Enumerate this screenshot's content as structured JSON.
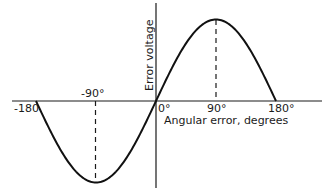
{
  "chart_data": {
    "type": "line",
    "title": "",
    "xlabel": "Angular error, degrees",
    "ylabel": "Error voltage",
    "x_ticks": [
      "-180",
      "-90°",
      "0°",
      "90°",
      "180°"
    ],
    "x_tick_values": [
      -180,
      -90,
      0,
      90,
      180
    ],
    "xlim": [
      -200,
      240
    ],
    "ylim": [
      -1.05,
      1.05
    ],
    "grid": false,
    "legend": null,
    "series": [
      {
        "name": "Error voltage",
        "function": "sin(x)",
        "x": [
          -180,
          -150,
          -120,
          -90,
          -60,
          -30,
          0,
          30,
          60,
          90,
          120,
          150,
          180
        ],
        "values": [
          0,
          -0.5,
          -0.866,
          -1,
          -0.866,
          -0.5,
          0,
          0.5,
          0.866,
          1,
          0.866,
          0.5,
          0
        ]
      }
    ],
    "annotations": [
      {
        "type": "dashed-vertical",
        "x": -90,
        "from": 0,
        "to": -1
      },
      {
        "type": "dashed-vertical",
        "x": 90,
        "from": 0,
        "to": 1
      }
    ]
  },
  "labels": {
    "tick_m180": "-180",
    "tick_m90": "-90°",
    "tick_0": "0°",
    "tick_90": "90°",
    "tick_180": "180°",
    "xlabel": "Angular error, degrees",
    "ylabel": "Error voltage"
  }
}
